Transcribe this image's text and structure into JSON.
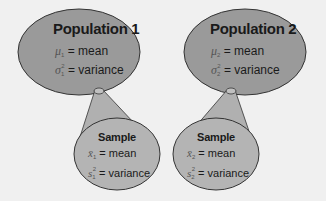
{
  "colors": {
    "background": "#f0f0f0",
    "population_fill": "#9a9a9a",
    "sample_fill": "#b4b4b4",
    "cone_fill": "#b0b0b0",
    "outline": "#333333"
  },
  "populations": [
    {
      "title": "Population 1",
      "mean_symbol": "μ",
      "mean_subscript": "1",
      "mean_label": "= mean",
      "variance_symbol": "σ",
      "variance_subscript": "1",
      "variance_superscript": "2",
      "variance_label": "= variance"
    },
    {
      "title": "Population 2",
      "mean_symbol": "μ",
      "mean_subscript": "2",
      "mean_label": "= mean",
      "variance_symbol": "σ",
      "variance_subscript": "2",
      "variance_superscript": "2",
      "variance_label": "= variance"
    }
  ],
  "samples": [
    {
      "title": "Sample",
      "mean_symbol": "x̄",
      "mean_subscript": "1",
      "mean_label": "= mean",
      "variance_symbol": "s",
      "variance_subscript": "1",
      "variance_superscript": "2",
      "variance_label": "= variance"
    },
    {
      "title": "Sample",
      "mean_symbol": "x̄",
      "mean_subscript": "2",
      "mean_label": "= mean",
      "variance_symbol": "s",
      "variance_subscript": "2",
      "variance_superscript": "2",
      "variance_label": "= variance"
    }
  ]
}
